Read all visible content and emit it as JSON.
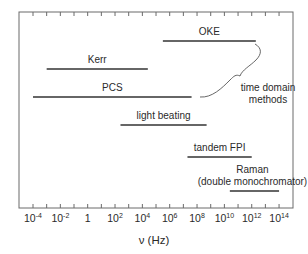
{
  "chart_data": {
    "type": "range-bar",
    "title": "",
    "xlabel": "ν (Hz)",
    "ylabel": "",
    "xscale": "log10",
    "xlim_log10": [
      -5,
      15
    ],
    "grid": false,
    "legend": null,
    "x_tick_labels": [
      {
        "log": -4,
        "base": "10",
        "exp": "-4"
      },
      {
        "log": -2,
        "base": "10",
        "exp": "-2"
      },
      {
        "log": 0,
        "base": "1",
        "exp": ""
      },
      {
        "log": 2,
        "base": "10",
        "exp": "2"
      },
      {
        "log": 4,
        "base": "10",
        "exp": "4"
      },
      {
        "log": 6,
        "base": "10",
        "exp": "6"
      },
      {
        "log": 8,
        "base": "10",
        "exp": "8"
      },
      {
        "log": 10,
        "base": "10",
        "exp": "10"
      },
      {
        "log": 12,
        "base": "10",
        "exp": "12"
      },
      {
        "log": 14,
        "base": "10",
        "exp": "14"
      }
    ],
    "series": [
      {
        "name": "OKE",
        "label_lines": [
          "OKE"
        ],
        "log_min": 5.5,
        "log_max": 12.3,
        "row": 0
      },
      {
        "name": "Kerr",
        "label_lines": [
          "Kerr"
        ],
        "log_min": -3.0,
        "log_max": 4.4,
        "row": 1
      },
      {
        "name": "PCS",
        "label_lines": [
          "PCS"
        ],
        "log_min": -4.0,
        "log_max": 7.6,
        "row": 2
      },
      {
        "name": "light beating",
        "label_lines": [
          "light beating"
        ],
        "log_min": 2.4,
        "log_max": 8.7,
        "row": 3
      },
      {
        "name": "tandem FPI",
        "label_lines": [
          "tandem FPI"
        ],
        "log_min": 7.3,
        "log_max": 12.0,
        "row": 4
      },
      {
        "name": "Raman (double monochromator)",
        "label_lines": [
          "Raman",
          "(double monochromator)"
        ],
        "log_min": 10.4,
        "log_max": 14.0,
        "row": 5
      }
    ],
    "annotations": [
      {
        "text_lines": [
          "time domain",
          "methods"
        ],
        "type": "brace",
        "groups": [
          "OKE",
          "PCS"
        ]
      }
    ]
  }
}
